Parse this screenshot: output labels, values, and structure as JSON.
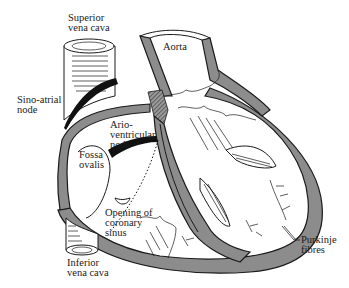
{
  "figure": {
    "colors": {
      "wall": "#8c8c8c",
      "ink": "#1a1a1a",
      "background": "#ffffff"
    }
  },
  "labels": {
    "superior_vena_cava": [
      "Superior",
      "vena cava"
    ],
    "aorta": [
      "Aorta"
    ],
    "sino_atrial_node": [
      "Sino-atrial",
      "node"
    ],
    "ario_ventricular_node": [
      "Ario-",
      "ventricular",
      "node"
    ],
    "fossa_ovalis": [
      "Fossa",
      "ovalis"
    ],
    "opening_of_coronary_sinus": [
      "Opening of",
      "coronary",
      "sinus"
    ],
    "inferior_vena_cava": [
      "Inferior",
      "vena cava"
    ],
    "purkinje_fibres": [
      "Purkinje",
      "fibres"
    ]
  }
}
